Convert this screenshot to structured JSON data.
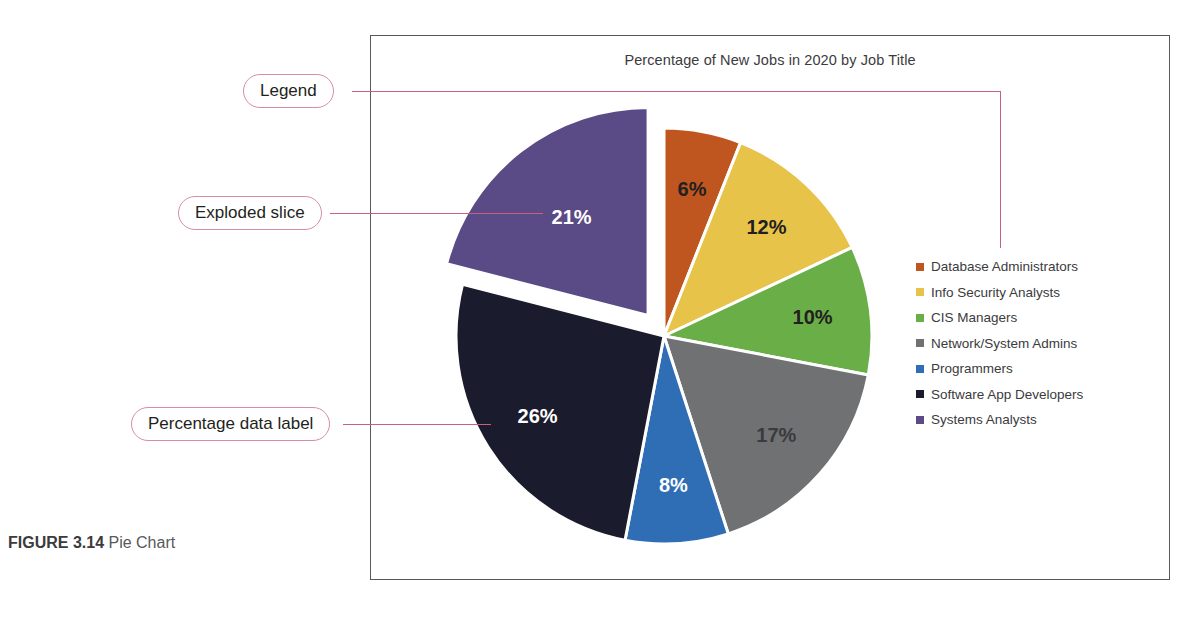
{
  "figure": {
    "number_label": "FIGURE 3.14",
    "caption": "Pie Chart"
  },
  "chart": {
    "title": "Percentage of New Jobs in 2020 by Job Title"
  },
  "callouts": [
    {
      "id": "legend",
      "label": "Legend"
    },
    {
      "id": "exploded",
      "label": "Exploded slice"
    },
    {
      "id": "data-label",
      "label": "Percentage data label"
    }
  ],
  "legend": {
    "items": [
      {
        "label": "Database Administrators",
        "color": "#c0561f"
      },
      {
        "label": "Info Security Analysts",
        "color": "#e8c349"
      },
      {
        "label": "CIS Managers",
        "color": "#6aae48"
      },
      {
        "label": "Network/System Admins",
        "color": "#6f7173"
      },
      {
        "label": "Programmers",
        "color": "#2f6eb5"
      },
      {
        "label": "Software App Developers",
        "color": "#1b1b2e"
      },
      {
        "label": "Systems Analysts",
        "color": "#5a4a85"
      }
    ]
  },
  "chart_data": {
    "type": "pie",
    "title": "Percentage of New Jobs in 2020 by Job Title",
    "xlabel": "",
    "ylabel": "",
    "legend_position": "right",
    "exploded_slice": "Systems Analysts",
    "categories": [
      "Database Administrators",
      "Info Security Analysts",
      "CIS Managers",
      "Network/System Admins",
      "Programmers",
      "Software App Developers",
      "Systems Analysts"
    ],
    "values": [
      6,
      12,
      10,
      17,
      8,
      26,
      21
    ],
    "value_labels": [
      "6%",
      "12%",
      "10%",
      "17%",
      "8%",
      "26%",
      "21%"
    ],
    "colors": [
      "#c0561f",
      "#e8c349",
      "#6aae48",
      "#6f7173",
      "#2f6eb5",
      "#1b1b2e",
      "#5a4a85"
    ],
    "label_text_colors": [
      "#231f20",
      "#231f20",
      "#231f20",
      "#3b3b3d",
      "#ffffff",
      "#ffffff",
      "#ffffff"
    ],
    "total": 100
  }
}
